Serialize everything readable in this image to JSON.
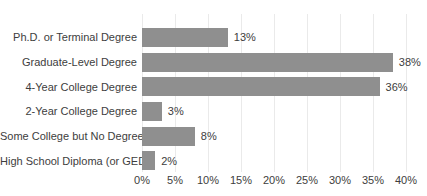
{
  "chart_data": {
    "type": "bar",
    "orientation": "horizontal",
    "title": "",
    "categories": [
      "Ph.D. or Terminal Degree",
      "Graduate-Level Degree",
      "4-Year College Degree",
      "2-Year College Degree",
      "Some College but No Degree",
      "High School Diploma (or GED)"
    ],
    "values": [
      13,
      38,
      36,
      3,
      8,
      2
    ],
    "value_labels": [
      "13%",
      "38%",
      "36%",
      "3%",
      "8%",
      "2%"
    ],
    "x_ticks": [
      "0%",
      "5%",
      "10%",
      "15%",
      "20%",
      "25%",
      "30%",
      "35%",
      "40%"
    ],
    "xlim": [
      0,
      40
    ],
    "xlabel": "",
    "ylabel": "",
    "grid": true,
    "legend": "none",
    "bar_color": "#8f8f8f",
    "gridline_color": "#eaeaea",
    "text_color": "#3d3d3d"
  }
}
